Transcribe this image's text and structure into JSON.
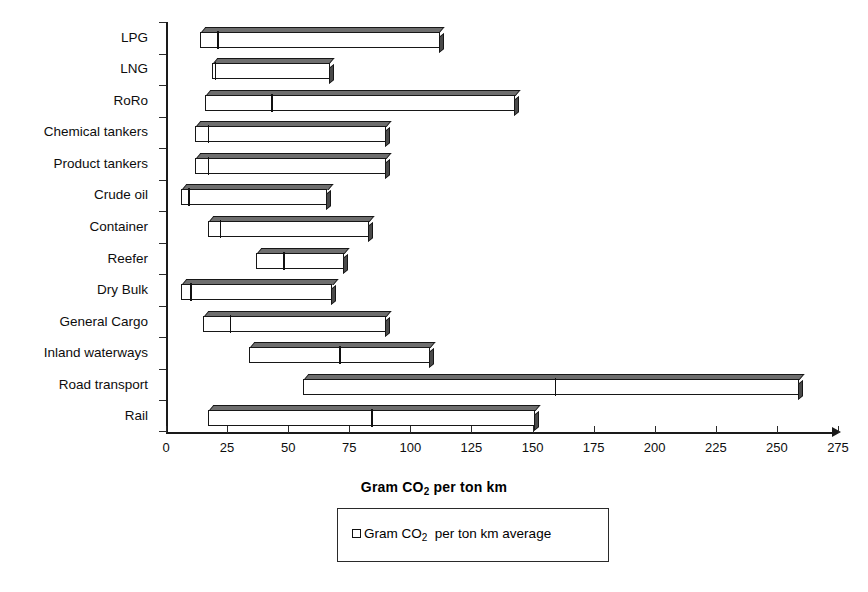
{
  "chart_data": {
    "type": "bar",
    "subtype": "horizontal-range-bar",
    "title": "",
    "xlabel": "Gram CO2 per ton km",
    "xlabel_rich": "Gram CO<sub>2</sub> per ton km",
    "ylabel": "",
    "xlim": [
      0,
      275
    ],
    "xticks": [
      0,
      25,
      50,
      75,
      100,
      125,
      150,
      175,
      200,
      225,
      250,
      275
    ],
    "grid": false,
    "legend_position": "below-axis-center",
    "legend": [
      {
        "label": "Gram CO2  per ton km average",
        "label_rich": "Gram CO<sub>2</sub>&nbsp; per ton km average",
        "marker": "open-square",
        "color": "#ffffff",
        "edge_color": "#111111"
      }
    ],
    "categories": [
      "LPG",
      "LNG",
      "RoRo",
      "Chemical tankers",
      "Product tankers",
      "Crude oil",
      "Container",
      "Reefer",
      "Dry Bulk",
      "General Cargo",
      "Inland waterways",
      "Road transport",
      "Rail"
    ],
    "series": [
      {
        "name": "Gram CO2 per ton km range (min, average, max)",
        "fields": [
          "min",
          "average",
          "max"
        ],
        "values": [
          {
            "category": "LPG",
            "min": 14,
            "average": 21,
            "max": 112
          },
          {
            "category": "LNG",
            "min": 19,
            "average": 20,
            "max": 67
          },
          {
            "category": "RoRo",
            "min": 16,
            "average": 43,
            "max": 143
          },
          {
            "category": "Chemical tankers",
            "min": 12,
            "average": 17,
            "max": 90
          },
          {
            "category": "Product tankers",
            "min": 12,
            "average": 17,
            "max": 90
          },
          {
            "category": "Crude oil",
            "min": 6,
            "average": 9,
            "max": 66
          },
          {
            "category": "Container",
            "min": 17,
            "average": 22,
            "max": 83
          },
          {
            "category": "Reefer",
            "min": 37,
            "average": 48,
            "max": 73
          },
          {
            "category": "Dry Bulk",
            "min": 6,
            "average": 10,
            "max": 68
          },
          {
            "category": "General Cargo",
            "min": 15,
            "average": 26,
            "max": 90
          },
          {
            "category": "Inland waterways",
            "min": 34,
            "average": 71,
            "max": 108
          },
          {
            "category": "Road transport",
            "min": 56,
            "average": 159,
            "max": 259
          },
          {
            "category": "Rail",
            "min": 17,
            "average": 84,
            "max": 151
          }
        ]
      }
    ],
    "colors": {
      "bar_face": "#ffffff",
      "bar_edge": "#171717",
      "bar_top": "#6e6e6e",
      "bar_side": "#4a4a4a",
      "axis": "#1a1a1a",
      "text": "#0d0d0d"
    }
  }
}
